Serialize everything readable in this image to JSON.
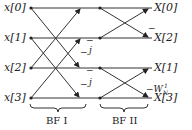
{
  "inputs": [
    "x[0]",
    "x[1]",
    "x[2]",
    "x[3]"
  ],
  "outputs": [
    "X[0]",
    "X[2]",
    "X[1]",
    "X[3]"
  ],
  "stage1": {
    "label": "BF I",
    "twiddles": [
      "−",
      "−j",
      "−",
      "−j"
    ]
  },
  "stage2": {
    "label": "BF II",
    "twiddles": [
      "−",
      "−W",
      "N",
      "1"
    ]
  },
  "marks": {
    "minus": "−",
    "j": "j"
  }
}
